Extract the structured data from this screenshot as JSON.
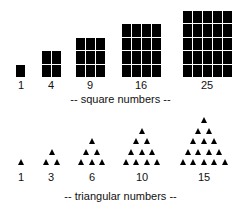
{
  "square_section": {
    "caption": "-- square numbers --",
    "items": [
      {
        "label": "1",
        "n": 1,
        "left": 16,
        "bottom": 77,
        "label_x": 21
      },
      {
        "label": "4",
        "n": 2,
        "left": 42,
        "bottom": 77,
        "label_x": 51
      },
      {
        "label": "9",
        "n": 3,
        "left": 76,
        "bottom": 77,
        "label_x": 90
      },
      {
        "label": "16",
        "n": 4,
        "left": 122,
        "bottom": 77,
        "label_x": 141
      },
      {
        "label": "25",
        "n": 5,
        "left": 183,
        "bottom": 77,
        "label_x": 207
      }
    ]
  },
  "triangular_section": {
    "caption": "-- triangular numbers --",
    "items": [
      {
        "label": "1",
        "rows": 1,
        "center_x": 21,
        "label_x": 21
      },
      {
        "label": "3",
        "rows": 2,
        "center_x": 52,
        "label_x": 51
      },
      {
        "label": "6",
        "rows": 3,
        "center_x": 92,
        "label_x": 92
      },
      {
        "label": "10",
        "rows": 4,
        "center_x": 142,
        "label_x": 142
      },
      {
        "label": "15",
        "rows": 5,
        "center_x": 204,
        "label_x": 204
      }
    ]
  },
  "colors": {
    "shape": "#000000",
    "text": "#111111",
    "background": "#ffffff"
  }
}
